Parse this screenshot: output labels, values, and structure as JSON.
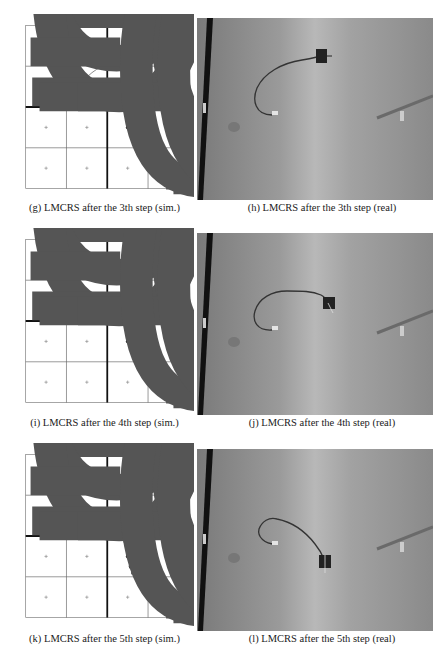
{
  "figure": {
    "panels": [
      {
        "id": "g",
        "caption": "(g) LMCRS after the 3th step (sim.)",
        "type": "simulation-plot",
        "robot": {
          "x": 0.3,
          "y": 0.63,
          "heading": "east"
        },
        "target_dot": {
          "x": 0.25,
          "y": -0.25
        },
        "trajectory": [
          [
            -0.18,
            0.0
          ],
          [
            -0.28,
            0.04
          ],
          [
            -0.33,
            0.15
          ],
          [
            -0.3,
            0.3
          ],
          [
            -0.18,
            0.43
          ],
          [
            0.0,
            0.53
          ],
          [
            0.15,
            0.59
          ],
          [
            0.3,
            0.63
          ]
        ]
      },
      {
        "id": "h",
        "caption": "(h) LMCRS after the 3th step (real)",
        "type": "photo"
      },
      {
        "id": "i",
        "caption": "(i) LMCRS after the 4th step (sim.)",
        "type": "simulation-plot",
        "robot": {
          "x": 0.3,
          "y": 0.14,
          "heading": "south"
        },
        "target_dot": {
          "x": 0.25,
          "y": -0.25
        },
        "trajectory": [
          [
            -0.12,
            0.0
          ],
          [
            -0.22,
            0.04
          ],
          [
            -0.29,
            0.13
          ],
          [
            -0.26,
            0.25
          ],
          [
            -0.15,
            0.33
          ],
          [
            -0.02,
            0.35
          ],
          [
            0.1,
            0.3
          ],
          [
            0.2,
            0.2
          ],
          [
            0.3,
            0.14
          ]
        ]
      },
      {
        "id": "j",
        "caption": "(j) LMCRS after the 4th step (real)",
        "type": "photo"
      },
      {
        "id": "k",
        "caption": "(k) LMCRS after the 5th step (sim.)",
        "type": "simulation-plot",
        "robot": {
          "x": 0.3,
          "y": -0.37,
          "heading": "south"
        },
        "target_dot": {
          "x": 0.25,
          "y": -0.25
        },
        "trajectory": [
          [
            -0.03,
            0.0
          ],
          [
            -0.12,
            0.04
          ],
          [
            -0.22,
            0.12
          ],
          [
            -0.2,
            0.17
          ],
          [
            -0.08,
            0.16
          ],
          [
            0.07,
            0.1
          ],
          [
            0.17,
            0.0
          ],
          [
            0.23,
            -0.12
          ],
          [
            0.25,
            -0.25
          ],
          [
            0.3,
            -0.37
          ]
        ]
      },
      {
        "id": "l",
        "caption": "(l) LMCRS after the 5th step (real)",
        "type": "photo"
      }
    ],
    "axes": {
      "xlim": [
        -1,
        1
      ],
      "ylim": [
        -1,
        1
      ],
      "x_ticks": [
        "-1",
        "-0.5",
        "0",
        "0.5",
        "1"
      ],
      "y_ticks": [
        "1",
        "0.5",
        "0",
        "-0.5",
        "-1"
      ],
      "grid_markers": "plus signs at (±0.25, ±0.75) cell centers"
    }
  }
}
